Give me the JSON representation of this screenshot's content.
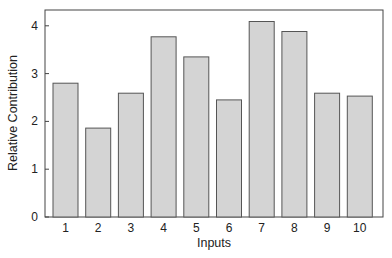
{
  "chart_data": {
    "type": "bar",
    "title": "",
    "xlabel": "Inputs",
    "ylabel": "Relative Contribution",
    "categories": [
      "1",
      "2",
      "3",
      "4",
      "5",
      "6",
      "7",
      "8",
      "9",
      "10"
    ],
    "values": [
      2.8,
      1.86,
      2.59,
      3.77,
      3.35,
      2.45,
      4.09,
      3.88,
      2.59,
      2.53
    ],
    "ylim": [
      0,
      4.35
    ],
    "yticks": [
      0,
      1,
      2,
      3,
      4
    ],
    "grid": false,
    "legend": null,
    "bar_fill": "#d4d4d4",
    "bar_edge": "#555555"
  }
}
